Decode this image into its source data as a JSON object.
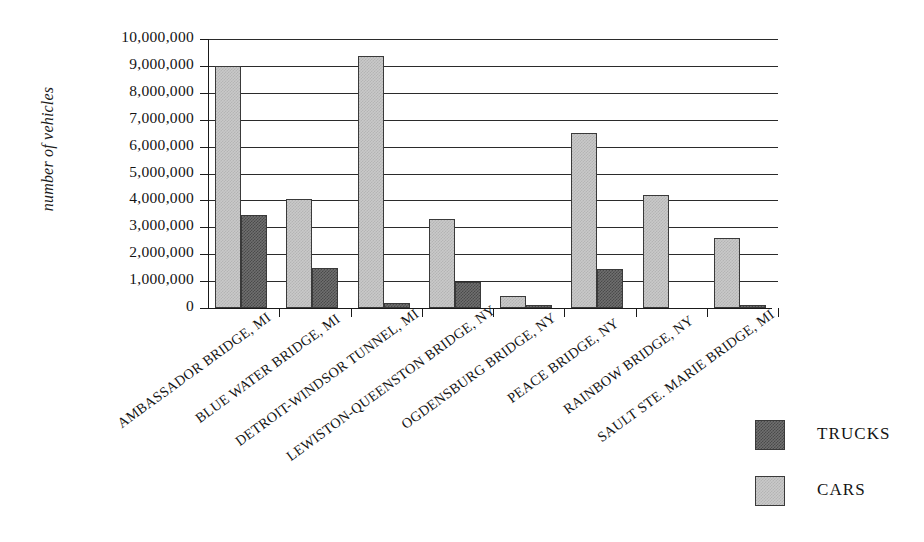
{
  "chart_data": {
    "type": "bar",
    "title": "",
    "subtitle": "",
    "xlabel": "",
    "ylabel": "number of vehicles",
    "ylim": [
      0,
      10000000
    ],
    "ytick_step": 1000000,
    "grid": true,
    "orientation": "vertical",
    "grouping": "grouped",
    "legend_position": "bottom-right",
    "categories": [
      "AMBASSADOR BRIDGE, MI",
      "BLUE WATER BRIDGE, MI",
      "DETROIT-WINDSOR TUNNEL, MI",
      "LEWISTON-QUEENSTON BRIDGE, NY",
      "OGDENSBURG BRIDGE, NY",
      "PEACE BRIDGE, NY",
      "RAINBOW BRIDGE, NY",
      "SAULT STE. MARIE BRIDGE, MI"
    ],
    "series": [
      {
        "name": "CARS",
        "color": "#c9c9c9",
        "values": [
          9000000,
          4050000,
          9350000,
          3300000,
          450000,
          6500000,
          4200000,
          2600000
        ]
      },
      {
        "name": "TRUCKS",
        "color": "#6f6f6f",
        "values": [
          3450000,
          1500000,
          180000,
          950000,
          50000,
          1450000,
          0,
          100000
        ]
      }
    ],
    "ytick_labels": [
      "0",
      "1,000,000",
      "2,000,000",
      "3,000,000",
      "4,000,000",
      "5,000,000",
      "6,000,000",
      "7,000,000",
      "8,000,000",
      "9,000,000",
      "10,000,000"
    ]
  },
  "legend": {
    "items": [
      {
        "label": "TRUCKS",
        "swatch": "trucks"
      },
      {
        "label": "CARS",
        "swatch": "cars"
      }
    ]
  }
}
